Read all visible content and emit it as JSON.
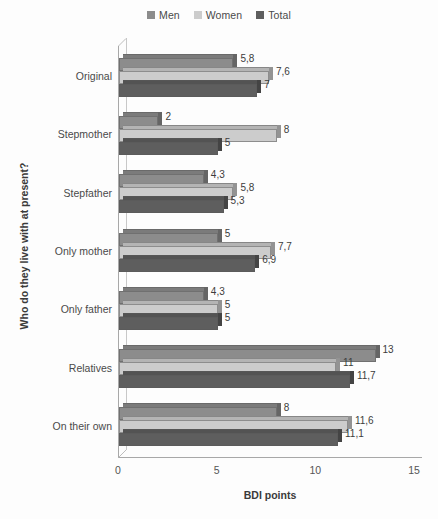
{
  "chart_data": {
    "type": "bar",
    "orientation": "horizontal",
    "title": "",
    "xlabel": "BDI points",
    "ylabel": "Who do they live with at present?",
    "xlim": [
      0,
      15
    ],
    "xticks": [
      0,
      5,
      10,
      15
    ],
    "grid": false,
    "legend_position": "top-center",
    "decimal_separator": ",",
    "categories": [
      "Original",
      "Stepmother",
      "Stepfather",
      "Only mother",
      "Only father",
      "Relatives",
      "On their own"
    ],
    "series": [
      {
        "name": "Men",
        "color": "#8c8c8c",
        "values": [
          5.8,
          2,
          4.3,
          5,
          4.3,
          13,
          8
        ],
        "labels": [
          "5,8",
          "2",
          "4,3",
          "5",
          "4,3",
          "13",
          "8"
        ]
      },
      {
        "name": "Women",
        "color": "#cccccc",
        "values": [
          7.6,
          8,
          5.8,
          7.7,
          5,
          11,
          11.6
        ],
        "labels": [
          "7,6",
          "8",
          "5,8",
          "7,7",
          "5",
          "11",
          "11,6"
        ]
      },
      {
        "name": "Total",
        "color": "#5e5e5e",
        "values": [
          7,
          5,
          5.3,
          6.9,
          5,
          11.7,
          11.1
        ],
        "labels": [
          "7",
          "5",
          "5,3",
          "6,9",
          "5",
          "11,7",
          "11,1"
        ]
      }
    ]
  },
  "legend": {
    "entries": [
      {
        "label": "Men",
        "color": "#8c8c8c"
      },
      {
        "label": "Women",
        "color": "#cccccc"
      },
      {
        "label": "Total",
        "color": "#5e5e5e"
      }
    ]
  },
  "axes": {
    "x_title": "BDI points",
    "y_title": "Who do they live with at present?",
    "x_tick_labels": [
      "0",
      "5",
      "10",
      "15"
    ]
  }
}
